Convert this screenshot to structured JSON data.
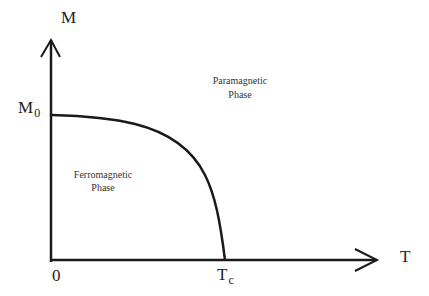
{
  "diagram": {
    "title": "",
    "y_axis": {
      "label": "M",
      "tick_label_main": "M",
      "tick_label_sub": "0",
      "origin_label": "0"
    },
    "x_axis": {
      "label": "T",
      "tick_label_main": "T",
      "tick_label_sub": "c"
    },
    "regions": {
      "paramagnetic": {
        "line1": "Paramagnetic",
        "line2": "Phase"
      },
      "ferromagnetic": {
        "line1": "Ferromagnetic",
        "line2": "Phase"
      }
    },
    "colors": {
      "line": "#1a1a1a",
      "text": "#222222",
      "background": "#ffffff"
    }
  }
}
